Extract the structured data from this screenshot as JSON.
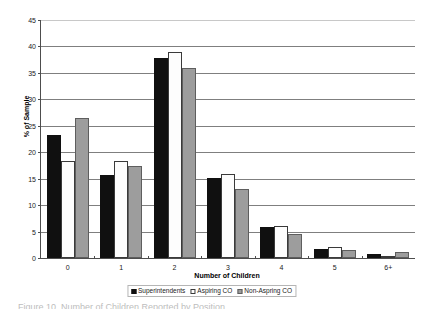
{
  "chart_data": {
    "type": "bar",
    "title": "",
    "xlabel": "Number of Children",
    "ylabel": "% of Sample",
    "categories": [
      "0",
      "1",
      "2",
      "3",
      "4",
      "5",
      "6+"
    ],
    "series": [
      {
        "name": "Superintendents",
        "color": "#101010",
        "values": [
          23.2,
          15.7,
          37.9,
          15.1,
          5.8,
          1.7,
          0.7
        ]
      },
      {
        "name": "Aspiring CO",
        "color": "#ffffff",
        "values": [
          18.3,
          18.4,
          38.9,
          15.8,
          6.0,
          2.0,
          0.4
        ]
      },
      {
        "name": "Non-Aspring CO",
        "color": "#9d9d9d",
        "values": [
          26.4,
          17.4,
          35.9,
          13.1,
          4.5,
          1.5,
          1.2
        ]
      }
    ],
    "ylim": [
      0,
      45
    ],
    "ytick_values": [
      0,
      5,
      10,
      15,
      20,
      25,
      30,
      35,
      40,
      45
    ],
    "ytick_labels": [
      "0",
      "5",
      "10",
      "15",
      "20",
      "25",
      "30",
      "35",
      "40",
      "45"
    ],
    "grid": true,
    "grid_axis": "y",
    "legend_position": "bottom"
  },
  "legend": {
    "items": [
      {
        "label": "Superintendents"
      },
      {
        "label": "Aspiring CO"
      },
      {
        "label": "Non-Aspring CO"
      }
    ]
  },
  "caption": {
    "text": "Figure 10. Number of Children Reported by Position"
  }
}
